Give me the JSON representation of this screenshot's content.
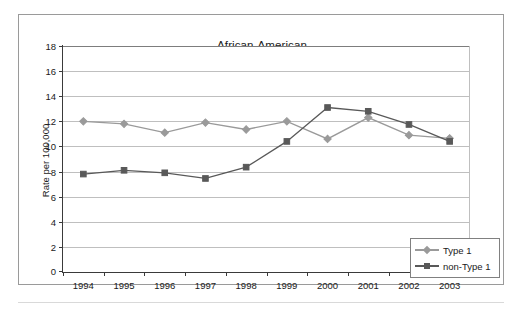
{
  "figure": {
    "title": "African-American",
    "y_axis_title": "Rate per 100,000"
  },
  "legend": {
    "items": [
      {
        "label": "Type 1",
        "color": "#9a9a9a",
        "marker": "diamond"
      },
      {
        "label": "non-Type 1",
        "color": "#595959",
        "marker": "square"
      }
    ]
  },
  "chart_data": {
    "type": "line",
    "title": "African-American",
    "xlabel": "",
    "ylabel": "Rate per 100,000",
    "x": [
      "1994",
      "1995",
      "1996",
      "1997",
      "1998",
      "1999",
      "2000",
      "2001",
      "2002",
      "2003"
    ],
    "categories": [
      "1994",
      "1995",
      "1996",
      "1997",
      "1998",
      "1999",
      "2000",
      "2001",
      "2002",
      "2003"
    ],
    "ylim": [
      0,
      18
    ],
    "yticks": [
      0,
      2,
      4,
      6,
      8,
      10,
      12,
      14,
      16,
      18
    ],
    "ytick_labels": [
      "0",
      "2",
      "4",
      "6",
      "8",
      "10",
      "12",
      "14",
      "16",
      "18"
    ],
    "grid": true,
    "legend_position": "lower right",
    "series": [
      {
        "name": "Type 1",
        "color": "#9a9a9a",
        "marker": "diamond",
        "values": [
          12.0,
          11.8,
          11.1,
          11.9,
          11.35,
          12.0,
          10.6,
          12.3,
          10.9,
          10.65
        ]
      },
      {
        "name": "non-Type 1",
        "color": "#595959",
        "marker": "square",
        "values": [
          7.8,
          8.1,
          7.9,
          7.45,
          8.35,
          10.4,
          13.1,
          12.8,
          11.75,
          10.4
        ]
      }
    ]
  },
  "colors": {
    "axis": "#3a3a3a",
    "grid": "#bfbfbf",
    "frame": "#9a9a9a",
    "text": "#1a1a1a",
    "background": "#ffffff"
  }
}
